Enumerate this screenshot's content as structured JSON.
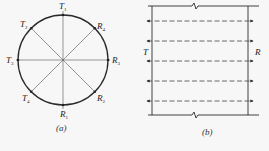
{
  "figure": {
    "panel_a": {
      "caption": "(a)",
      "description": "Circular cross-section with transmitters T and receivers R placed around perimeter, connected by diameters",
      "circle": {
        "cx": 63,
        "cy": 60,
        "r": 45
      },
      "nodes": [
        {
          "id": "T1",
          "letter": "T",
          "sub": "1",
          "angle_deg": 90
        },
        {
          "id": "R4",
          "letter": "R",
          "sub": "4",
          "angle_deg": 45
        },
        {
          "id": "R3",
          "letter": "R",
          "sub": "3",
          "angle_deg": 0
        },
        {
          "id": "R2",
          "letter": "R",
          "sub": "2",
          "angle_deg": -45
        },
        {
          "id": "R1",
          "letter": "R",
          "sub": "1",
          "angle_deg": -90
        },
        {
          "id": "T4",
          "letter": "T",
          "sub": "4",
          "angle_deg": -135
        },
        {
          "id": "T3",
          "letter": "T",
          "sub": "3",
          "angle_deg": 180
        },
        {
          "id": "T2",
          "letter": "T",
          "sub": "2",
          "angle_deg": 135
        }
      ],
      "paths": [
        {
          "from": "T1",
          "to": "R1"
        },
        {
          "from": "T2",
          "to": "R2"
        },
        {
          "from": "T3",
          "to": "R3"
        },
        {
          "from": "T4",
          "to": "R4"
        }
      ]
    },
    "panel_b": {
      "caption": "(b)",
      "description": "Parallel wall section with transmitter side T and receiver side R, five dashed parallel ray paths",
      "left_label": "T",
      "right_label": "R",
      "ray_count": 5,
      "ray_y": [
        21,
        41,
        61,
        81,
        101
      ]
    }
  },
  "colors": {
    "line": "#2a2a2a",
    "thin_line": "#555555",
    "background": "#f7f7f7"
  }
}
